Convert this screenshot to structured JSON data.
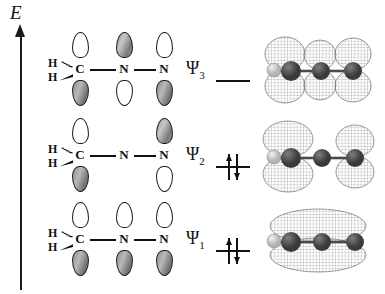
{
  "figure": {
    "axis": {
      "label": "E",
      "name": "energy-axis",
      "direction": "increasing upward"
    },
    "background_color": "#ffffff",
    "line_color": "#111111",
    "lobe_gray_color": "#9a9a9a",
    "lobe_white_color": "#ffffff"
  },
  "atoms": {
    "carbon": "C",
    "nitrogen_center": "N",
    "nitrogen_terminal": "N",
    "hydrogen_upper": "H",
    "hydrogen_lower": "H"
  },
  "levels": [
    {
      "id": "psi3",
      "label": "Ψ",
      "subscript": "3",
      "electrons": 0,
      "occupancy_symbol": "empty-level-line",
      "nodes": 2,
      "description": "antibonding, alternating phases on all three atoms",
      "orbitals": [
        {
          "atom": "C",
          "top": "white",
          "bottom": "gray",
          "present": true
        },
        {
          "atom": "N",
          "top": "gray",
          "bottom": "white",
          "present": true
        },
        {
          "atom": "N",
          "top": "white",
          "bottom": "gray",
          "present": true
        }
      ],
      "render": {
        "name": "psi3-isosurface",
        "lobe_count": 6,
        "description": "six mesh lobes, three above and three below the C-N-N axis"
      }
    },
    {
      "id": "psi2",
      "label": "Ψ",
      "subscript": "2",
      "electrons": 2,
      "occupancy_symbol": "paired-arrows",
      "nodes": 1,
      "description": "nonbonding, node at the central nitrogen",
      "orbitals": [
        {
          "atom": "C",
          "top": "white",
          "bottom": "gray",
          "present": true
        },
        {
          "atom": "N",
          "top": "none",
          "bottom": "none",
          "present": false
        },
        {
          "atom": "N",
          "top": "gray",
          "bottom": "white",
          "present": true
        }
      ],
      "render": {
        "name": "psi2-isosurface",
        "lobe_count": 4,
        "description": "four mesh lobes with a node at the central atom"
      }
    },
    {
      "id": "psi1",
      "label": "Ψ",
      "subscript": "1",
      "electrons": 2,
      "occupancy_symbol": "paired-arrows",
      "nodes": 0,
      "description": "bonding, all orbitals in phase",
      "orbitals": [
        {
          "atom": "C",
          "top": "white",
          "bottom": "gray",
          "present": true
        },
        {
          "atom": "N",
          "top": "white",
          "bottom": "gray",
          "present": true
        },
        {
          "atom": "N",
          "top": "white",
          "bottom": "gray",
          "present": true
        }
      ],
      "render": {
        "name": "psi1-isosurface",
        "lobe_count": 2,
        "description": "single continuous envelope spanning all three atoms, above and below"
      }
    }
  ],
  "bonds": {
    "c_h_upper": "hashed-wedge",
    "c_h_lower": "solid-wedge",
    "c_n": "single-line",
    "n_n": "single-line"
  },
  "render_spheres": {
    "hydrogen_color": "#d8d8d8",
    "heavy_atom_color": "#4a4a4a",
    "mesh_color": "#8a8a8a"
  }
}
